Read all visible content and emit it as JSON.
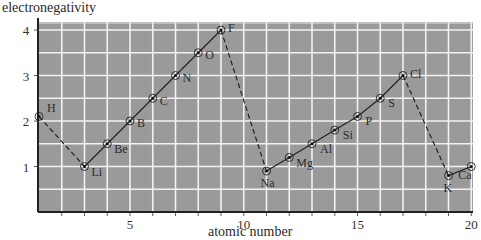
{
  "chart_data": {
    "type": "line",
    "title": "",
    "xlabel": "atomic number",
    "ylabel": "electronegativity",
    "xlim": [
      1,
      20
    ],
    "ylim": [
      0,
      4.2
    ],
    "xticks": [
      5,
      10,
      15,
      20
    ],
    "yticks": [
      1,
      2,
      3,
      4
    ],
    "grid": true,
    "grid_step": {
      "x": 1,
      "y": 0.5
    },
    "background": "#9a9a9a",
    "series": [
      {
        "name": "period-1-to-2 (dashed)",
        "style": "dashed",
        "points": [
          {
            "element": "H",
            "x": 1,
            "y": 2.1
          },
          {
            "element": "Li",
            "x": 3,
            "y": 1.0
          }
        ]
      },
      {
        "name": "period 2",
        "style": "solid",
        "points": [
          {
            "element": "Li",
            "x": 3,
            "y": 1.0
          },
          {
            "element": "Be",
            "x": 4,
            "y": 1.5
          },
          {
            "element": "B",
            "x": 5,
            "y": 2.0
          },
          {
            "element": "C",
            "x": 6,
            "y": 2.5
          },
          {
            "element": "N",
            "x": 7,
            "y": 3.0
          },
          {
            "element": "O",
            "x": 8,
            "y": 3.5
          },
          {
            "element": "F",
            "x": 9,
            "y": 4.0
          }
        ]
      },
      {
        "name": "period-2-to-3 (dashed)",
        "style": "dashed",
        "points": [
          {
            "element": "F",
            "x": 9,
            "y": 4.0
          },
          {
            "element": "Na",
            "x": 11,
            "y": 0.9
          }
        ]
      },
      {
        "name": "period 3",
        "style": "solid",
        "points": [
          {
            "element": "Na",
            "x": 11,
            "y": 0.9
          },
          {
            "element": "Mg",
            "x": 12,
            "y": 1.2
          },
          {
            "element": "Al",
            "x": 13,
            "y": 1.5
          },
          {
            "element": "Si",
            "x": 14,
            "y": 1.8
          },
          {
            "element": "P",
            "x": 15,
            "y": 2.1
          },
          {
            "element": "S",
            "x": 16,
            "y": 2.5
          },
          {
            "element": "Cl",
            "x": 17,
            "y": 3.0
          }
        ]
      },
      {
        "name": "period-3-to-4 (dashed)",
        "style": "dashed",
        "points": [
          {
            "element": "Cl",
            "x": 17,
            "y": 3.0
          },
          {
            "element": "K",
            "x": 19,
            "y": 0.8
          }
        ]
      },
      {
        "name": "period 4",
        "style": "solid",
        "points": [
          {
            "element": "K",
            "x": 19,
            "y": 0.8
          },
          {
            "element": "Ca",
            "x": 20,
            "y": 1.0
          }
        ]
      }
    ]
  },
  "labels": {
    "ylabel": "electronegativity",
    "xlabel": "atomic number"
  }
}
